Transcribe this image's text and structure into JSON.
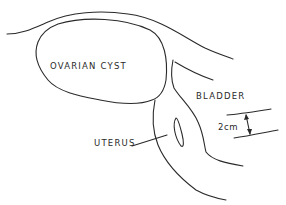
{
  "diagram": {
    "type": "anatomical ultrasound schematic",
    "labels": {
      "ovarian_cyst": "OVARIAN CYST",
      "bladder": "BLADDER",
      "uterus": "UTERUS",
      "measurement": "2cm"
    },
    "colors": {
      "line": "#2a2a2a",
      "background": "#ffffff"
    }
  }
}
